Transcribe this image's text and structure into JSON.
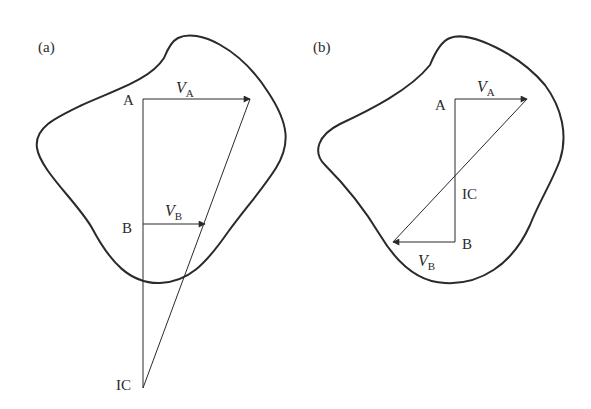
{
  "figure": {
    "panels": [
      {
        "id": "a",
        "label": "(a)",
        "points": {
          "A": "A",
          "B": "B",
          "IC": "IC"
        },
        "vectors": [
          {
            "name": "V",
            "sub": "A"
          },
          {
            "name": "V",
            "sub": "B"
          }
        ]
      },
      {
        "id": "b",
        "label": "(b)",
        "points": {
          "A": "A",
          "B": "B",
          "IC": "IC"
        },
        "vectors": [
          {
            "name": "V",
            "sub": "A"
          },
          {
            "name": "V",
            "sub": "B"
          }
        ]
      }
    ],
    "colors": {
      "stroke": "#2a2a2a",
      "background": "#ffffff"
    }
  }
}
